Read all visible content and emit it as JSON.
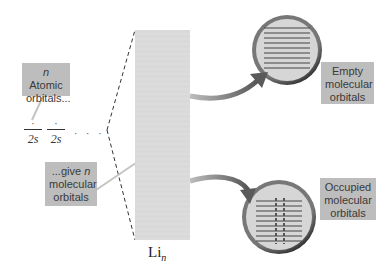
{
  "diagram": {
    "callouts": {
      "atomic_orbitals": {
        "italic_prefix": "n",
        "line1_rest": " Atomic",
        "line2": "orbitals..."
      },
      "give_n": {
        "line1_prefix": "...give ",
        "italic": "n",
        "line2": "molecular",
        "line3": "orbitals"
      },
      "empty": {
        "line1": "Empty",
        "line2": "molecular",
        "line3": "orbitals"
      },
      "occupied": {
        "line1": "Occupied",
        "line2": "molecular",
        "line3": "orbitals"
      }
    },
    "atomic_orbitals": [
      {
        "label": "2s",
        "electron": "·"
      },
      {
        "label": "2s",
        "electron": "·"
      }
    ],
    "ellipsis": "· · ·",
    "band_label": {
      "element": "Li",
      "subscript": "n"
    },
    "colors": {
      "callout_bg": "#bdbdbd",
      "band": "#d9d9d9",
      "circle_fill": "#d6d6d6",
      "circle_ring": "#3a3a3a",
      "arrow": "#6a6a6a",
      "lines": "#444444"
    }
  }
}
